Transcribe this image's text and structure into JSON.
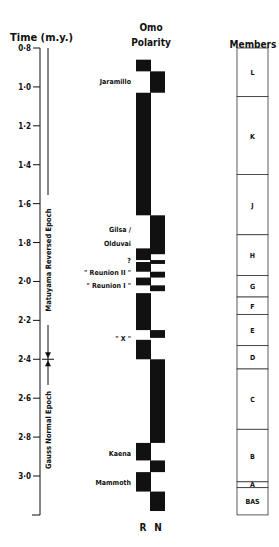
{
  "headers": {
    "time": "Time (m.y.)",
    "polarity_line1": "Omo",
    "polarity_line2": "Polarity",
    "members": "Members"
  },
  "time_axis": {
    "min": 0.8,
    "max": 3.2,
    "ticks": [
      {
        "value": 0.8,
        "label": "0·8"
      },
      {
        "value": 1.0,
        "label": "1·0"
      },
      {
        "value": 1.2,
        "label": "1·2"
      },
      {
        "value": 1.4,
        "label": "1·4"
      },
      {
        "value": 1.6,
        "label": "1·6"
      },
      {
        "value": 1.8,
        "label": "1·8"
      },
      {
        "value": 2.0,
        "label": "2·0"
      },
      {
        "value": 2.2,
        "label": "2·2"
      },
      {
        "value": 2.4,
        "label": "2·4"
      },
      {
        "value": 2.6,
        "label": "2·6"
      },
      {
        "value": 2.8,
        "label": "2·8"
      },
      {
        "value": 3.0,
        "label": "3·0"
      }
    ]
  },
  "epochs": [
    {
      "label": "Matuyama  Reversed  Epoch",
      "start": 0.8,
      "end": 2.4
    },
    {
      "label": "Gauss  Normal  Epoch",
      "start": 2.4,
      "end": 3.2
    }
  ],
  "epoch_boundary": 2.4,
  "polarity": {
    "column_labels": {
      "reversed": "R",
      "normal": "N"
    },
    "reversed": [
      [
        0.87,
        0.92
      ],
      [
        1.03,
        1.66
      ],
      [
        1.83,
        1.89
      ],
      [
        1.9,
        1.95
      ],
      [
        1.98,
        2.02
      ],
      [
        2.06,
        2.25
      ],
      [
        2.3,
        2.4
      ],
      [
        2.83,
        2.92
      ],
      [
        2.98,
        3.08
      ]
    ],
    "normal": [
      [
        0.92,
        1.03
      ],
      [
        1.66,
        1.86
      ],
      [
        1.89,
        1.91
      ],
      [
        1.95,
        1.98
      ],
      [
        2.02,
        2.05
      ],
      [
        2.25,
        2.29
      ],
      [
        2.4,
        2.83
      ],
      [
        2.92,
        2.98
      ],
      [
        3.08,
        3.18
      ]
    ]
  },
  "events": [
    {
      "label": "Jaramillo",
      "at": 0.97
    },
    {
      "label": "Gilsa /",
      "at": 1.73
    },
    {
      "label": "Olduvai",
      "at": 1.8
    },
    {
      "label": "?",
      "at": 1.89
    },
    {
      "label": "\" Reunion II \"",
      "at": 1.95
    },
    {
      "label": "\" Reunion I \"",
      "at": 2.02
    },
    {
      "label": "\" X \"",
      "at": 2.29
    },
    {
      "label": "Kaena",
      "at": 2.88
    },
    {
      "label": "Mammoth",
      "at": 3.03
    }
  ],
  "members": [
    {
      "label": "L",
      "start": 0.8,
      "end": 1.05
    },
    {
      "label": "K",
      "start": 1.05,
      "end": 1.45
    },
    {
      "label": "J",
      "start": 1.45,
      "end": 1.76
    },
    {
      "label": "H",
      "start": 1.76,
      "end": 1.97
    },
    {
      "label": "G",
      "start": 1.97,
      "end": 2.08
    },
    {
      "label": "F",
      "start": 2.08,
      "end": 2.17
    },
    {
      "label": "E",
      "start": 2.17,
      "end": 2.33
    },
    {
      "label": "D",
      "start": 2.33,
      "end": 2.45
    },
    {
      "label": "C",
      "start": 2.45,
      "end": 2.76
    },
    {
      "label": "B",
      "start": 2.76,
      "end": 3.03
    },
    {
      "label": "A",
      "start": 3.03,
      "end": 3.06
    },
    {
      "label": "BAS",
      "start": 3.06,
      "end": 3.2
    }
  ]
}
